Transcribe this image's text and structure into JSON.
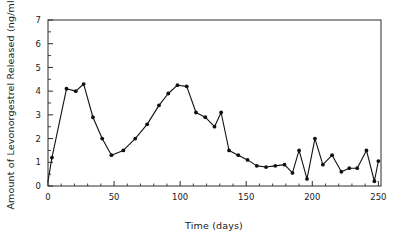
{
  "figure": {
    "background": "#ffffff",
    "line_color": "#111111",
    "axis_color": "#2b2b2b",
    "text_color": "#1a1a1a"
  },
  "chart_data": {
    "type": "line",
    "title": "",
    "xlabel": "Time (days)",
    "ylabel": "Amount of Levonorgestrel Released (ng/ml)",
    "xlim": [
      0,
      252
    ],
    "ylim": [
      0,
      7
    ],
    "xticks": [
      0,
      50,
      100,
      150,
      200,
      250
    ],
    "xtick_labels": [
      "0",
      "50",
      "100",
      "150",
      "200",
      "250"
    ],
    "x_minor_tick_interval": 10,
    "yticks": [
      0,
      1,
      2,
      3,
      4,
      5,
      6,
      7
    ],
    "ytick_labels": [
      "0",
      "1",
      "2",
      "3",
      "4",
      "5",
      "6",
      "7"
    ],
    "y_minor_tick_interval": 0.5,
    "grid": false,
    "legend": false,
    "marker": "filled-circle",
    "series": [
      {
        "name": "Levonorgestrel release",
        "x": [
          0,
          3,
          14,
          21,
          27,
          34,
          41,
          48,
          57,
          66,
          75,
          84,
          91,
          98,
          105,
          112,
          119,
          126,
          131,
          137,
          144,
          151,
          158,
          165,
          172,
          179,
          185,
          190,
          196,
          202,
          208,
          215,
          222,
          228,
          234,
          241,
          247,
          250
        ],
        "y": [
          0.2,
          1.2,
          4.1,
          4.0,
          4.3,
          2.9,
          2.0,
          1.3,
          1.5,
          2.0,
          2.6,
          3.4,
          3.9,
          4.25,
          4.2,
          3.1,
          2.9,
          2.5,
          3.1,
          1.5,
          1.3,
          1.1,
          0.85,
          0.8,
          0.85,
          0.9,
          0.55,
          1.5,
          0.3,
          2.0,
          0.9,
          1.3,
          0.6,
          0.75,
          0.75,
          1.5,
          0.2,
          1.05
        ]
      }
    ]
  },
  "plot_geometry": {
    "left": 48,
    "right": 381,
    "top": 20,
    "bottom": 186
  }
}
